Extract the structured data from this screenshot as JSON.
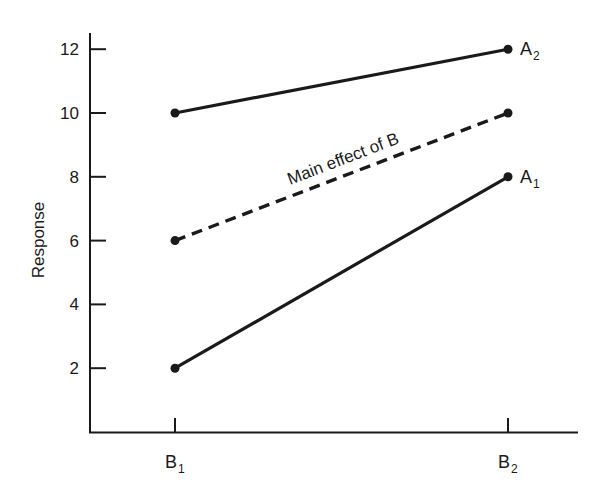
{
  "chart_data": {
    "type": "line",
    "title": "",
    "xlabel": "",
    "ylabel": "Response",
    "categories": [
      "B1",
      "B2"
    ],
    "category_labels": [
      {
        "main": "B",
        "sub": "1"
      },
      {
        "main": "B",
        "sub": "2"
      }
    ],
    "yticks": [
      2,
      4,
      6,
      8,
      10,
      12
    ],
    "ylim": [
      0,
      12.5
    ],
    "grid": false,
    "legend": "none (direct line labels)",
    "series": [
      {
        "name": "A2",
        "label_main": "A",
        "label_sub": "2",
        "values": [
          10,
          12
        ],
        "style": "solid"
      },
      {
        "name": "Main effect of B",
        "values": [
          6,
          10
        ],
        "style": "dashed"
      },
      {
        "name": "A1",
        "label_main": "A",
        "label_sub": "1",
        "values": [
          2,
          8
        ],
        "style": "solid"
      }
    ],
    "annotations": [
      {
        "text": "Main effect of B",
        "along_series": "Main effect of B"
      }
    ]
  },
  "colors": {
    "ink": "#1a1a1a",
    "background": "#ffffff"
  }
}
